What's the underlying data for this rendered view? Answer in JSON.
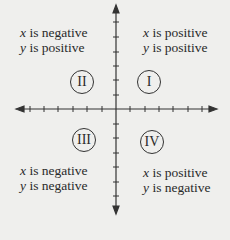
{
  "diagram": {
    "title": "",
    "axes": {
      "horizontal": {
        "from_x": 17,
        "to_x": 216,
        "y": 109,
        "arrows": "both",
        "tick_count_each_side": 6
      },
      "vertical": {
        "x": 116,
        "from_y": 5,
        "to_y": 213,
        "arrows": "both",
        "tick_count_each_side": 6
      }
    },
    "quadrants": [
      {
        "numeral": "I",
        "line1_var": "x",
        "line1_text": " is positive",
        "line2_var": "y",
        "line2_text": " is positive"
      },
      {
        "numeral": "II",
        "line1_var": "x",
        "line1_text": " is negative",
        "line2_var": "y",
        "line2_text": " is positive"
      },
      {
        "numeral": "III",
        "line1_var": "x",
        "line1_text": " is negative",
        "line2_var": "y",
        "line2_text": " is negative"
      },
      {
        "numeral": "IV",
        "line1_var": "x",
        "line1_text": " is positive",
        "line2_var": "y",
        "line2_text": " is negative"
      }
    ],
    "colors": {
      "background": "#efefed",
      "ink": "#2a2a2a"
    }
  }
}
